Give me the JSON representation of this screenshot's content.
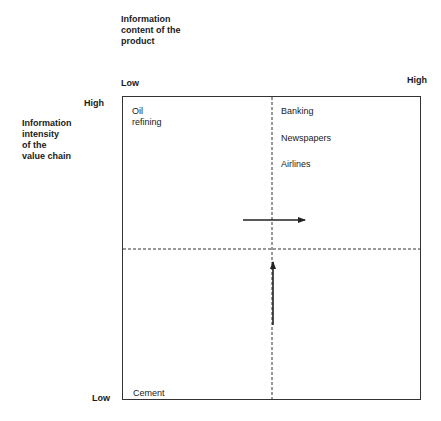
{
  "diagram": {
    "x_axis": {
      "title_lines": [
        "Information",
        "content of the",
        "product"
      ],
      "low_label": "Low",
      "high_label": "High"
    },
    "y_axis": {
      "title_lines": [
        "Information",
        "intensity",
        "of the",
        "value chain"
      ],
      "high_label": "High",
      "low_label": "Low"
    },
    "quadrants": {
      "top_left": [
        "Oil",
        "refining"
      ],
      "top_right": [
        "Banking",
        "Newspapers",
        "Airlines"
      ],
      "bottom_left": [
        "Cement"
      ]
    },
    "arrows": [
      {
        "direction": "right",
        "meaning": "increasing information content of the product"
      },
      {
        "direction": "up",
        "meaning": "increasing information intensity of the value chain"
      }
    ],
    "colors": {
      "line": "#333333",
      "text": "#1a1a1a"
    }
  }
}
